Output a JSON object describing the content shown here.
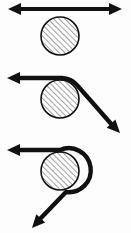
{
  "figure": {
    "canvas": {
      "width": 131,
      "height": 233,
      "background": "#fdfdfd"
    },
    "style": {
      "stroke_color": "#111111",
      "hatch_color": "#3a3a3a",
      "fill_color": "#ffffff",
      "line_width": 4.2,
      "hatch_width": 0.9,
      "hatch_spacing": 4,
      "hatch_angle_deg": 45
    },
    "panels": [
      {
        "id": "panel-1",
        "name": "zero-wrap-tangent-line",
        "label": "Straight belt, no wrap (contact angle 0°)",
        "cylinder": {
          "cx": 60,
          "cy": 36,
          "r": 19
        },
        "belt": {
          "path": "M 14 9 L 116 9",
          "arrow_start": true,
          "arrow_end": true,
          "arrow_start_tip": [
            8,
            9
          ],
          "arrow_end_tip": [
            122,
            9
          ]
        }
      },
      {
        "id": "panel-2",
        "name": "quarter-wrap-over-top",
        "label": "Belt over top, exits down-right (contact angle ≈ 90°)",
        "cylinder": {
          "cx": 60,
          "cy": 99,
          "r": 19
        },
        "belt": {
          "path": "M 14 78 L 62 78 A 21 21 0 0 1 77.3 85.4 L 113 126",
          "arrow_start": true,
          "arrow_end": true,
          "arrow_start_tip": [
            7,
            78
          ],
          "arrow_end_tip": [
            120,
            133
          ]
        }
      },
      {
        "id": "panel-3",
        "name": "three-quarter-wrap-around",
        "label": "Belt wrapped around, exits down-left (contact angle ≈ 225°)",
        "cylinder": {
          "cx": 60,
          "cy": 171,
          "r": 19
        },
        "belt": {
          "path": "M 14 150 L 60 150 A 22 22 0 1 1 66 192 L 40 219",
          "arrow_start": true,
          "arrow_end": true,
          "arrow_start_tip": [
            7,
            150
          ],
          "arrow_end_tip": [
            32,
            228
          ]
        }
      }
    ],
    "arrowhead": {
      "length": 13,
      "half_width": 6
    }
  }
}
